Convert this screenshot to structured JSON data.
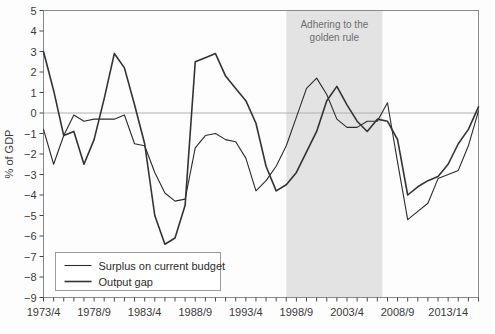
{
  "chart_data": {
    "type": "line",
    "title": "",
    "xlabel": "",
    "ylabel": "% of GDP",
    "ylim": [
      -9,
      5
    ],
    "ytick_step": 1,
    "yticks": [
      5,
      4,
      3,
      2,
      1,
      0,
      -1,
      -2,
      -3,
      -4,
      -5,
      -6,
      -7,
      -8,
      -9
    ],
    "ytick_labels": [
      "5",
      "4",
      "3",
      "2",
      "1",
      "0",
      "−1",
      "−2",
      "−3",
      "−4",
      "−5",
      "−6",
      "−7",
      "−8",
      "−9"
    ],
    "grid": false,
    "zero_line": true,
    "legend_position": "bottom-left",
    "x_start_index": 0,
    "x_categories": [
      "1973/4",
      "1974/5",
      "1975/6",
      "1976/7",
      "1977/8",
      "1978/9",
      "1979/80",
      "1980/1",
      "1981/2",
      "1982/3",
      "1983/4",
      "1984/5",
      "1985/6",
      "1986/7",
      "1987/8",
      "1988/9",
      "1989/90",
      "1990/1",
      "1991/2",
      "1992/3",
      "1993/4",
      "1994/5",
      "1995/6",
      "1996/7",
      "1997/8",
      "1998/9",
      "1999/00",
      "2000/1",
      "2001/2",
      "2002/3",
      "2003/4",
      "2004/5",
      "2005/6",
      "2006/7",
      "2007/8",
      "2008/9",
      "2009/10",
      "2010/11",
      "2011/12",
      "2012/13",
      "2013/14",
      "2014/15",
      "2015/16",
      "2016/17"
    ],
    "xtick_labels": [
      {
        "index": 0,
        "label": "1973/4"
      },
      {
        "index": 5,
        "label": "1978/9"
      },
      {
        "index": 10,
        "label": "1983/4"
      },
      {
        "index": 15,
        "label": "1988/9"
      },
      {
        "index": 20,
        "label": "1993/4"
      },
      {
        "index": 25,
        "label": "1998/9"
      },
      {
        "index": 30,
        "label": "2003/4"
      },
      {
        "index": 35,
        "label": "2008/9"
      },
      {
        "index": 40,
        "label": "2013/14"
      }
    ],
    "series": [
      {
        "name": "Surplus on current budget",
        "color": "#2b2b2b",
        "width": 1.1,
        "values": [
          -0.8,
          -2.5,
          -1.1,
          -0.1,
          -0.4,
          -0.3,
          -0.3,
          -0.3,
          -0.1,
          -1.5,
          -1.6,
          -2.9,
          -3.9,
          -4.3,
          -4.2,
          -1.7,
          -1.1,
          -1.0,
          -1.3,
          -1.4,
          -2.2,
          -3.8,
          -3.3,
          -2.6,
          -1.6,
          -0.2,
          1.2,
          1.7,
          0.9,
          -0.3,
          -0.7,
          -0.7,
          -0.4,
          -0.4,
          0.5,
          -2.4,
          -5.2,
          -4.8,
          -4.4,
          -3.2,
          -3.0,
          -2.8,
          -1.6,
          0.1
        ]
      },
      {
        "name": "Output gap",
        "color": "#333333",
        "width": 1.6,
        "values": [
          3.0,
          1.1,
          -1.1,
          -0.9,
          -2.5,
          -1.3,
          0.7,
          2.9,
          2.2,
          0.4,
          -1.5,
          -5.0,
          -6.4,
          -6.1,
          -4.5,
          2.5,
          2.7,
          2.9,
          1.8,
          1.2,
          0.6,
          -0.5,
          -2.6,
          -3.8,
          -3.5,
          -2.9,
          -1.9,
          -0.9,
          0.6,
          1.3,
          0.4,
          -0.4,
          -0.9,
          -0.3,
          -0.4,
          -1.3,
          -4.0,
          -3.6,
          -3.3,
          -3.1,
          -2.5,
          -1.5,
          -0.8,
          0.3
        ]
      }
    ],
    "annotations": [
      {
        "name": "golden-rule-band",
        "type": "vertical-band",
        "start_index": 24,
        "end_index": 33.5,
        "color": "#e3e3e3",
        "label_lines": [
          "Adhering to the",
          "golden rule"
        ]
      }
    ]
  },
  "legend": {
    "items": [
      {
        "label": "Surplus on current budget"
      },
      {
        "label": "Output gap"
      }
    ]
  }
}
